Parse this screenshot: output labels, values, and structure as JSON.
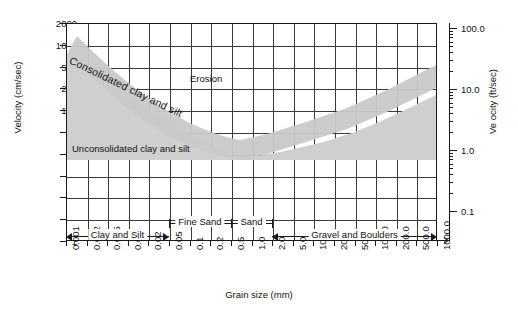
{
  "chart_data": {
    "type": "line",
    "title": "",
    "xlabel": "Grain size (mm)",
    "ylabel": "Velocity (cm/sec)",
    "y2label": "Ve ocity (ft/sec)",
    "x_ticks": [
      "0.001",
      "0.002",
      "0.005",
      "0.01",
      "0.02",
      "0.05",
      "0.1",
      "0.2",
      "0.5",
      "1.0",
      "2.0",
      "5.0",
      "10.0",
      "20.0",
      "50.0",
      "100.0",
      "200.0",
      "500.0",
      "1000.0"
    ],
    "y_ticks": [
      "2000",
      "1000",
      "500",
      "200",
      "100",
      "50",
      "20",
      "10",
      "5",
      "2",
      "1"
    ],
    "y2_ticks": [
      "100.0",
      "10.0",
      "1.0",
      "0.1"
    ],
    "grid": true,
    "legend_position": "none",
    "annotations": [
      {
        "name": "erosion",
        "text": "Erosion"
      },
      {
        "name": "consolidated",
        "text": "Consolidated clay and silt"
      },
      {
        "name": "unconsolidated",
        "text": "Unconsolidated clay and silt"
      }
    ],
    "categories": [
      {
        "label": "Clay and Silt",
        "from": "0.001",
        "to": "0.05"
      },
      {
        "label": "Fine Sand",
        "from": "0.05",
        "to": "0.5"
      },
      {
        "label": "Sand",
        "from": "0.5",
        "to": "2.0"
      },
      {
        "label": "Gravel and Boulders",
        "from": "2.0",
        "to": "1000.0"
      }
    ],
    "series": [
      {
        "name": "critical erosion velocity band (upper)",
        "points": [
          [
            0.001,
            700
          ],
          [
            0.05,
            55
          ],
          [
            0.2,
            40
          ],
          [
            0.5,
            47
          ],
          [
            2.0,
            80
          ],
          [
            10.0,
            170
          ],
          [
            100.0,
            500
          ],
          [
            1000.0,
            1500
          ]
        ]
      },
      {
        "name": "critical erosion velocity band (lower)",
        "points": [
          [
            0.001,
            400
          ],
          [
            0.05,
            30
          ],
          [
            0.2,
            25
          ],
          [
            0.5,
            30
          ],
          [
            2.0,
            50
          ],
          [
            10.0,
            110
          ],
          [
            100.0,
            320
          ],
          [
            1000.0,
            950
          ]
        ]
      }
    ]
  },
  "axes": {
    "left_label": "Velocity (cm/sec)",
    "right_label": "Ve ocity (ft/sec)",
    "bottom_label": "Grain size (mm)"
  },
  "labels": {
    "erosion": "Erosion",
    "consolidated": "Consolidated clay and silt",
    "unconsolidated": "Unconsolidated clay and silt"
  },
  "colors": {
    "band": "#cccccc",
    "grid": "#3a3a3a",
    "frame": "#1a1a1a",
    "text": "#111111",
    "background": "#ffffff"
  }
}
